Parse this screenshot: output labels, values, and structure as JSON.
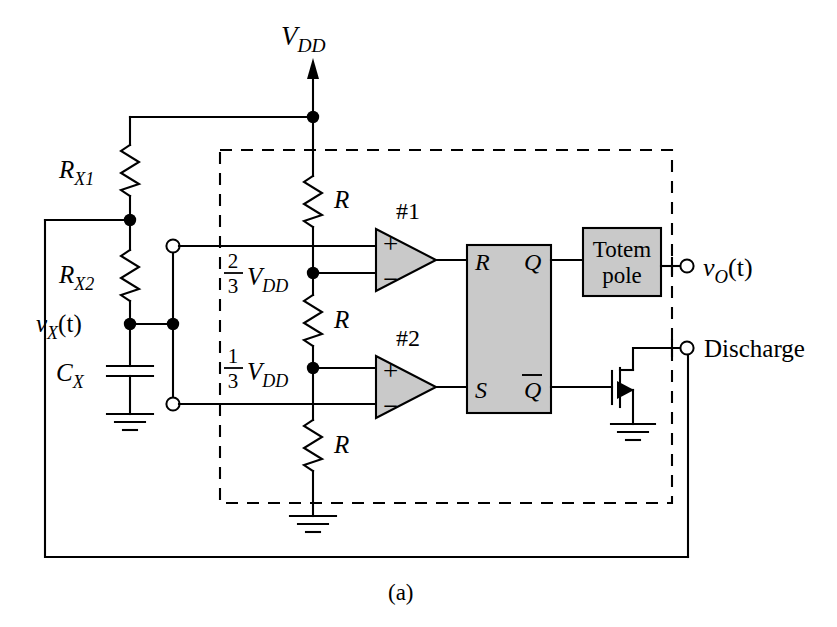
{
  "figure": {
    "caption": "(a)",
    "title_text": "555 timer astable multivibrator internal block diagram"
  },
  "labels": {
    "vdd": "V",
    "vdd_sub": "DD",
    "rx1": "R",
    "rx1_sub": "X1",
    "rx2": "R",
    "rx2_sub": "X2",
    "cx": "C",
    "cx_sub": "X",
    "vx": "v",
    "vx_sub": "X",
    "vx_arg": "(t)",
    "vo": "v",
    "vo_sub": "O",
    "vo_arg": "(t)",
    "r_top": "R",
    "r_mid": "R",
    "r_bot": "R",
    "two_thirds_num": "2",
    "two_thirds_den": "3",
    "two_thirds_v": "V",
    "two_thirds_sub": "DD",
    "one_third_num": "1",
    "one_third_den": "3",
    "one_third_v": "V",
    "one_third_sub": "DD",
    "comp1": "#1",
    "comp2": "#2",
    "plus": "+",
    "minus": "−",
    "ff_r": "R",
    "ff_s": "S",
    "ff_q": "Q",
    "ff_qbar": "Q",
    "totem_line1": "Totem",
    "totem_line2": "pole",
    "discharge": "Discharge"
  },
  "colors": {
    "ink": "#000000",
    "block_fill": "#c9c9c9",
    "paper": "#ffffff"
  },
  "blocks": [
    {
      "name": "flip-flop",
      "inputs": [
        "R",
        "S"
      ],
      "outputs": [
        "Q",
        "Q̄"
      ]
    },
    {
      "name": "totem-pole-output-stage",
      "text": "Totem pole"
    }
  ],
  "terminals": [
    {
      "name": "threshold-trigger-top",
      "type": "open-circle"
    },
    {
      "name": "threshold-trigger-bottom",
      "type": "open-circle"
    },
    {
      "name": "output",
      "label": "vO (t)",
      "type": "open-circle"
    },
    {
      "name": "discharge",
      "label": "Discharge",
      "type": "open-circle"
    }
  ],
  "components": [
    {
      "name": "RX1",
      "type": "resistor"
    },
    {
      "name": "RX2",
      "type": "resistor"
    },
    {
      "name": "CX",
      "type": "capacitor"
    },
    {
      "name": "R-upper",
      "type": "resistor"
    },
    {
      "name": "R-middle",
      "type": "resistor"
    },
    {
      "name": "R-lower",
      "type": "resistor"
    },
    {
      "name": "discharge-transistor",
      "type": "n-mosfet"
    }
  ]
}
